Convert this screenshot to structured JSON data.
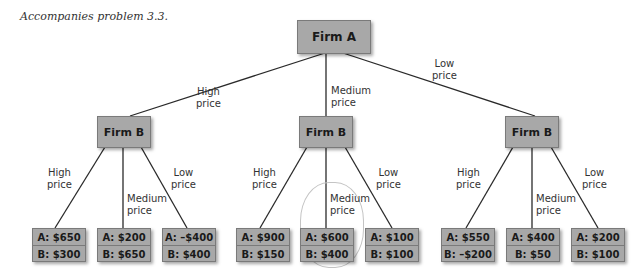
{
  "caption": "Accompanies problem 3.3.",
  "root": {
    "label": "Firm A"
  },
  "level1_edges": [
    {
      "label_line1": "High",
      "label_line2": "price"
    },
    {
      "label_line1": "Medium",
      "label_line2": "price"
    },
    {
      "label_line1": "Low",
      "label_line2": "price"
    }
  ],
  "firm_b_nodes": [
    {
      "label": "Firm B"
    },
    {
      "label": "Firm B"
    },
    {
      "label": "Firm B"
    }
  ],
  "branch_labels": {
    "high": {
      "line1": "High",
      "line2": "price"
    },
    "medium": {
      "line1": "Medium",
      "line2": "price"
    },
    "low": {
      "line1": "Low",
      "line2": "price"
    }
  },
  "payoffs": [
    {
      "a": "A: $650",
      "b": "B: $300"
    },
    {
      "a": "A: $200",
      "b": "B: $650"
    },
    {
      "a": "A: –$400",
      "b": "B: $400"
    },
    {
      "a": "A: $900",
      "b": "B: $150"
    },
    {
      "a": "A: $600",
      "b": "B: $400"
    },
    {
      "a": "A: $100",
      "b": "B: $100"
    },
    {
      "a": "A: $550",
      "b": "B: –$200"
    },
    {
      "a": "A: $400",
      "b": "B: $50"
    },
    {
      "a": "A: $200",
      "b": "B: $100"
    }
  ]
}
